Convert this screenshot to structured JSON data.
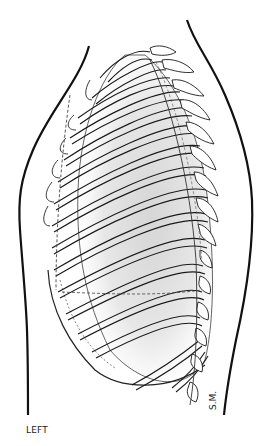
{
  "illustration": {
    "subject": "Lateral view of left ribcage with lung outline",
    "side_label": "LEFT",
    "artist_signature": "S.M.",
    "colors": {
      "background": "#ffffff",
      "line": "#1a1a1a",
      "lung_shading": "#d9d9d9"
    }
  }
}
